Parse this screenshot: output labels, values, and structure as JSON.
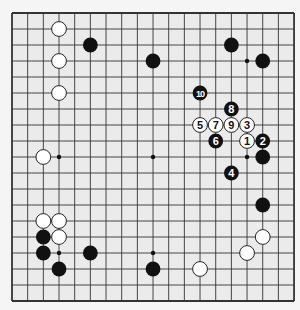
{
  "board": {
    "size": 19,
    "origin": {
      "x": 12,
      "y": 13
    },
    "spacing": {
      "x": 15.67,
      "y": 16
    },
    "background": "#ebebeb",
    "page_background": "#f5f5f5",
    "line_color": "#333333",
    "stone_black": "#111111",
    "stone_white": "#ffffff",
    "hoshi": [
      [
        3,
        3
      ],
      [
        9,
        3
      ],
      [
        15,
        3
      ],
      [
        3,
        9
      ],
      [
        9,
        9
      ],
      [
        15,
        9
      ],
      [
        3,
        15
      ],
      [
        9,
        15
      ],
      [
        15,
        15
      ]
    ]
  },
  "stones": [
    {
      "c": 3,
      "r": 1,
      "color": "white"
    },
    {
      "c": 3,
      "r": 3,
      "color": "white"
    },
    {
      "c": 3,
      "r": 5,
      "color": "white"
    },
    {
      "c": 2,
      "r": 9,
      "color": "white"
    },
    {
      "c": 2,
      "r": 13,
      "color": "white"
    },
    {
      "c": 3,
      "r": 13,
      "color": "white"
    },
    {
      "c": 3,
      "r": 14,
      "color": "white"
    },
    {
      "c": 12,
      "r": 16,
      "color": "white"
    },
    {
      "c": 15,
      "r": 15,
      "color": "white"
    },
    {
      "c": 16,
      "r": 14,
      "color": "white"
    },
    {
      "c": 5,
      "r": 2,
      "color": "black"
    },
    {
      "c": 9,
      "r": 3,
      "color": "black"
    },
    {
      "c": 14,
      "r": 2,
      "color": "black"
    },
    {
      "c": 16,
      "r": 3,
      "color": "black"
    },
    {
      "c": 16,
      "r": 9,
      "color": "black"
    },
    {
      "c": 2,
      "r": 14,
      "color": "black"
    },
    {
      "c": 2,
      "r": 15,
      "color": "black"
    },
    {
      "c": 5,
      "r": 15,
      "color": "black"
    },
    {
      "c": 3,
      "r": 16,
      "color": "black"
    },
    {
      "c": 9,
      "r": 16,
      "color": "black"
    },
    {
      "c": 16,
      "r": 12,
      "color": "black"
    }
  ],
  "numbered_stones": [
    {
      "n": "1",
      "c": 15,
      "r": 8,
      "color": "white"
    },
    {
      "n": "2",
      "c": 16,
      "r": 8,
      "color": "black"
    },
    {
      "n": "3",
      "c": 15,
      "r": 7,
      "color": "white"
    },
    {
      "n": "4",
      "c": 14,
      "r": 10,
      "color": "black"
    },
    {
      "n": "5",
      "c": 12,
      "r": 7,
      "color": "white"
    },
    {
      "n": "6",
      "c": 13,
      "r": 8,
      "color": "black"
    },
    {
      "n": "7",
      "c": 13,
      "r": 7,
      "color": "white"
    },
    {
      "n": "8",
      "c": 14,
      "r": 6,
      "color": "black"
    },
    {
      "n": "9",
      "c": 14,
      "r": 7,
      "color": "white"
    },
    {
      "n": "10",
      "c": 12,
      "r": 5,
      "color": "black"
    }
  ]
}
